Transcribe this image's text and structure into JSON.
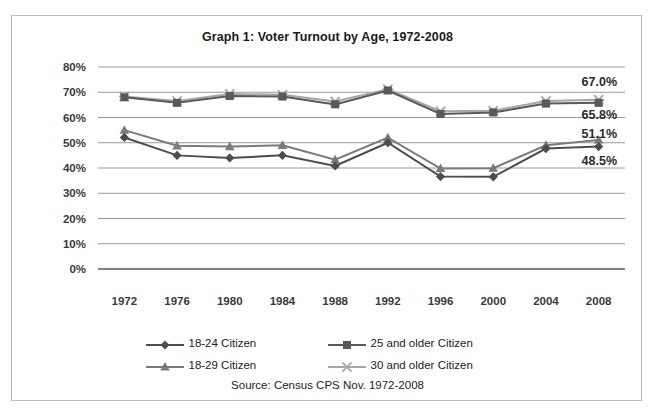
{
  "chart_data": {
    "type": "line",
    "title": "Graph 1: Voter Turnout by Age, 1972-2008",
    "xlabel": "",
    "ylabel": "",
    "ylim": [
      0,
      80
    ],
    "ytick_step": 10,
    "ytick_labels": [
      "80%",
      "70%",
      "60%",
      "50%",
      "40%",
      "30%",
      "20%",
      "10%",
      "0%"
    ],
    "grid": true,
    "legend_position": "bottom",
    "categories": [
      "1972",
      "1976",
      "1980",
      "1984",
      "1988",
      "1992",
      "1996",
      "2000",
      "2004",
      "2008"
    ],
    "series": [
      {
        "name": "18-24 Citizen",
        "marker": "diamond",
        "color": "#4d4d4d",
        "values": [
          52.1,
          45.0,
          44.0,
          45.0,
          40.8,
          50.0,
          36.6,
          36.5,
          47.7,
          48.5
        ]
      },
      {
        "name": "25 and older Citizen",
        "marker": "square",
        "color": "#595959",
        "values": [
          68.0,
          65.8,
          68.5,
          68.3,
          65.2,
          70.7,
          61.4,
          62.0,
          65.5,
          65.8
        ]
      },
      {
        "name": "18-29 Citizen",
        "marker": "triangle",
        "color": "#7a7a7a",
        "values": [
          55.0,
          48.8,
          48.5,
          49.0,
          43.3,
          52.0,
          39.8,
          39.9,
          49.0,
          51.1
        ]
      },
      {
        "name": "30 and older Citizen",
        "marker": "x",
        "color": "#a6a6a6",
        "values": [
          68.3,
          66.5,
          69.3,
          69.0,
          66.3,
          71.2,
          62.5,
          62.7,
          66.5,
          67.0
        ]
      }
    ],
    "point_labels": [
      {
        "text": "67.0%",
        "series": "30 and older Citizen",
        "category": "2008"
      },
      {
        "text": "65.8%",
        "series": "25 and older Citizen",
        "category": "2008"
      },
      {
        "text": "51.1%",
        "series": "18-29 Citizen",
        "category": "2008"
      },
      {
        "text": "48.5%",
        "series": "18-24 Citizen",
        "category": "2008"
      }
    ],
    "source_note": "Source: Census CPS Nov. 1972-2008"
  }
}
